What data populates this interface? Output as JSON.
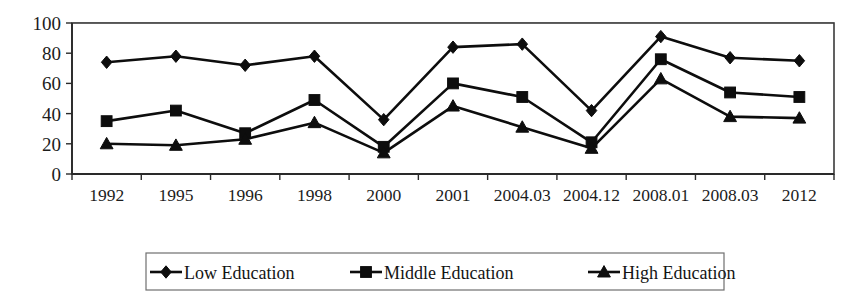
{
  "chart_data": {
    "type": "line",
    "title": "",
    "subtitle": "",
    "xlabel": "",
    "ylabel": "",
    "categories": [
      "1992",
      "1995",
      "1996",
      "1998",
      "2000",
      "2001",
      "2004.03",
      "2004.12",
      "2008.01",
      "2008.03",
      "2012"
    ],
    "series": [
      {
        "name": "Low Education",
        "marker": "diamond",
        "values": [
          74,
          78,
          72,
          78,
          36,
          84,
          86,
          42,
          91,
          77,
          75
        ]
      },
      {
        "name": "Middle Education",
        "marker": "square",
        "values": [
          35,
          42,
          27,
          49,
          18,
          60,
          51,
          21,
          76,
          54,
          51
        ]
      },
      {
        "name": "High Education",
        "marker": "triangle",
        "values": [
          20,
          19,
          23,
          34,
          14,
          45,
          31,
          17,
          63,
          38,
          37
        ]
      }
    ],
    "ylim": [
      0,
      100
    ],
    "yticks": [
      0,
      20,
      40,
      60,
      80,
      100
    ],
    "ytick_labels": [
      "0",
      "20",
      "40",
      "60",
      "80",
      "100"
    ],
    "grid": true,
    "grid_axis": "y",
    "legend_position": "bottom",
    "colors": {
      "series_line": "#0d0d0d",
      "marker": "#0d0d0d",
      "gridline": "#8e8e8e",
      "frame": "#3a3a3a",
      "background": "#ffffff",
      "text": "#1c1c1c"
    }
  },
  "legend": {
    "entries": [
      {
        "label": "Low Education",
        "marker": "diamond-marker-icon"
      },
      {
        "label": "Middle Education",
        "marker": "square-marker-icon"
      },
      {
        "label": "High Education",
        "marker": "triangle-marker-icon"
      }
    ]
  }
}
